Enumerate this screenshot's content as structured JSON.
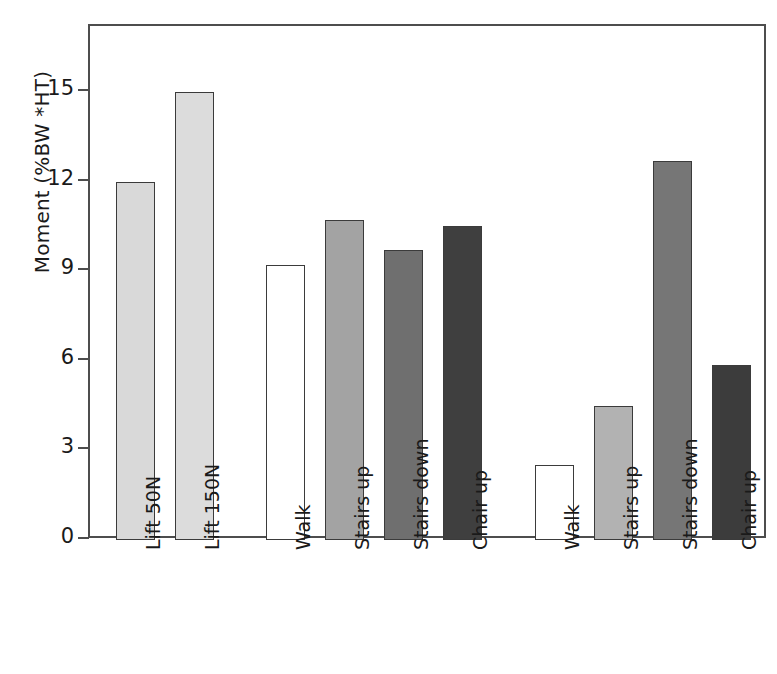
{
  "chart_data": {
    "type": "bar",
    "title": "",
    "xlabel": "",
    "ylabel": "Moment (%BW *HT)",
    "ylim": [
      0,
      16.5
    ],
    "grid": false,
    "legend": "none",
    "y_ticks": [
      0,
      3,
      6,
      9,
      12,
      15
    ],
    "y_tick_labels": [
      "0",
      "3",
      "6",
      "9",
      "12",
      "15"
    ],
    "group_labels": [
      "Hip",
      "Knee"
    ],
    "categories": [
      "Lift 50N",
      "Lift 150N",
      "Walk",
      "Stairs up",
      "Stairs down",
      "Chair up",
      "Walk",
      "Stairs up",
      "Stairs down",
      "Chair up"
    ],
    "values": [
      12.0,
      15.0,
      9.2,
      10.7,
      9.7,
      10.5,
      2.5,
      4.5,
      12.7,
      5.85
    ],
    "groups": [
      "Hip",
      "Hip",
      "Hip",
      "Hip",
      "Hip",
      "Hip",
      "Knee",
      "Knee",
      "Knee",
      "Knee"
    ],
    "bar_fills": [
      "#d9d9d9",
      "#dcdcdc",
      "#ffffff",
      "#a3a3a3",
      "#6f6f6f",
      "#3f3f3f",
      "#ffffff",
      "#b2b2b2",
      "#767676",
      "#3c3c3c"
    ],
    "bar_edge_color": "#3b3b3b",
    "axis_color": "#4d4d4d",
    "background": "#ffffff",
    "text_color": "#1a1a1a"
  },
  "axis": {
    "ticks": [
      {
        "label": "15",
        "value": 15
      },
      {
        "label": "12",
        "value": 12
      },
      {
        "label": "9",
        "value": 9
      },
      {
        "label": "6",
        "value": 6
      },
      {
        "label": "3",
        "value": 3
      },
      {
        "label": "0",
        "value": 0
      }
    ],
    "y_title": "Moment (%BW *HT)"
  },
  "groups": [
    {
      "label": "Hip"
    },
    {
      "label": "Knee"
    }
  ],
  "bars": [
    {
      "label": "Lift 50N",
      "value": 12.0,
      "group": "Hip"
    },
    {
      "label": "Lift 150N",
      "value": 15.0,
      "group": "Hip"
    },
    {
      "label": "Walk",
      "value": 9.2,
      "group": "Hip"
    },
    {
      "label": "Stairs up",
      "value": 10.7,
      "group": "Hip"
    },
    {
      "label": "Stairs down",
      "value": 9.7,
      "group": "Hip"
    },
    {
      "label": "Chair up",
      "value": 10.5,
      "group": "Hip"
    },
    {
      "label": "Walk",
      "value": 2.5,
      "group": "Knee"
    },
    {
      "label": "Stairs up",
      "value": 4.5,
      "group": "Knee"
    },
    {
      "label": "Stairs down",
      "value": 12.7,
      "group": "Knee"
    },
    {
      "label": "Chair up",
      "value": 5.85,
      "group": "Knee"
    }
  ],
  "layout": {
    "plot_left": 88,
    "plot_top": 24,
    "plot_width": 678,
    "plot_height": 514,
    "baseline_y": 538,
    "px_per_unit": 29.87,
    "bar_width": 39,
    "bar_lefts": [
      114,
      173,
      264,
      323,
      382,
      441,
      533,
      592,
      651,
      710
    ],
    "group_caption_x": [
      277,
      546
    ],
    "group_caption_y": 52,
    "cat_label_top": 550
  }
}
